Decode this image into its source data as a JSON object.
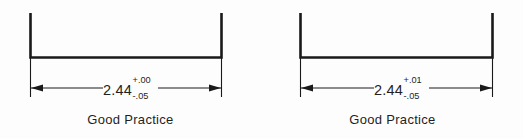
{
  "canvas": {
    "width": 523,
    "height": 138,
    "background_color": "#fdfdfd",
    "line_color": "#1a1a1a",
    "text_color": "#1f1f1f"
  },
  "figures": [
    {
      "id": "left",
      "caption": "Good Practice",
      "dimension": {
        "value": "2.44",
        "tolerance_upper": "+.00",
        "tolerance_lower": "-.05"
      },
      "shape": {
        "type": "u-channel",
        "left_wall_x": 30,
        "right_wall_x": 222,
        "wall_top_y": 13,
        "base_y": 57
      },
      "dimension_line": {
        "y": 88,
        "start_x": 30,
        "end_x": 222,
        "arrow_style": "filled-triangle",
        "extension_line_top_y": 58,
        "extension_line_bottom_y": 97
      }
    },
    {
      "id": "right",
      "caption": "Good Practice",
      "dimension": {
        "value": "2.44",
        "tolerance_upper": "+.01",
        "tolerance_lower": "-.05"
      },
      "shape": {
        "type": "u-channel",
        "left_wall_x": 38,
        "right_wall_x": 231,
        "wall_top_y": 13,
        "base_y": 57
      },
      "dimension_line": {
        "y": 88,
        "start_x": 38,
        "end_x": 231,
        "arrow_style": "filled-triangle",
        "extension_line_top_y": 58,
        "extension_line_bottom_y": 97
      }
    }
  ]
}
